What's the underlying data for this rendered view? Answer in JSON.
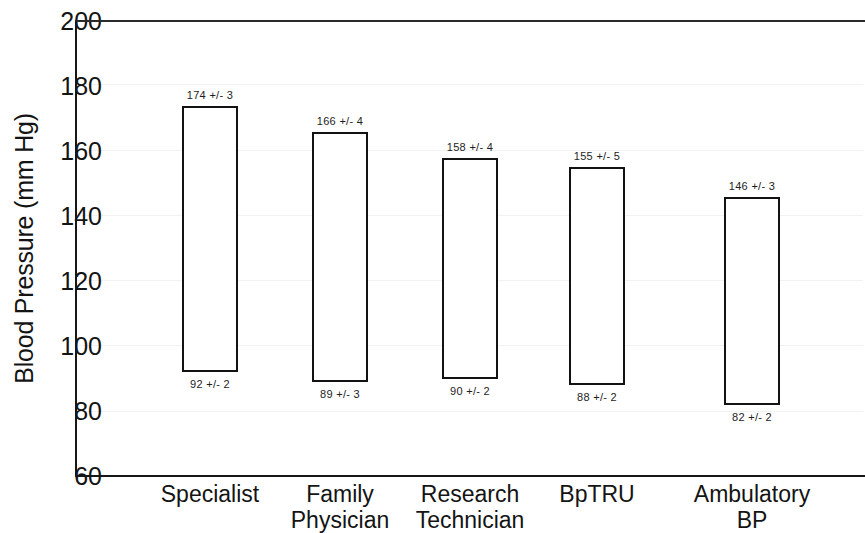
{
  "chart_data": {
    "type": "bar",
    "subtype": "floating-range-bar",
    "title": "",
    "xlabel": "",
    "ylabel": "Blood Pressure (mm Hg)",
    "ylim": [
      60,
      200
    ],
    "yticks": [
      200,
      180,
      160,
      140,
      120,
      100,
      80,
      60
    ],
    "ytick_labels": [
      "200",
      "180",
      "160",
      "140",
      "120",
      "100",
      "80",
      "60"
    ],
    "grid": false,
    "legend": null,
    "categories": [
      "Specialist",
      "Family\nPhysician",
      "Research\nTechnician",
      "BpTRU",
      "Ambulatory\nBP"
    ],
    "series": [
      {
        "name": "Systolic",
        "values": [
          174,
          166,
          158,
          155,
          146
        ],
        "errors": [
          3,
          4,
          4,
          5,
          3
        ],
        "labels": [
          "174 +/- 3",
          "166 +/- 4",
          "158 +/- 4",
          "155 +/- 5",
          "146 +/- 3"
        ]
      },
      {
        "name": "Diastolic",
        "values": [
          92,
          89,
          90,
          88,
          82
        ],
        "errors": [
          2,
          3,
          2,
          2,
          2
        ],
        "labels": [
          "92 +/- 2",
          "89 +/- 3",
          "90 +/- 2",
          "88 +/- 2",
          "82 +/- 2"
        ]
      }
    ],
    "bars": [
      {
        "category": "Specialist",
        "systolic": 174,
        "diastolic": 92,
        "top_label": "174 +/- 3",
        "bottom_label": "92 +/- 2"
      },
      {
        "category": "Family Physician",
        "systolic": 166,
        "diastolic": 89,
        "top_label": "166 +/- 4",
        "bottom_label": "89 +/- 3"
      },
      {
        "category": "Research Technician",
        "systolic": 158,
        "diastolic": 90,
        "top_label": "158 +/- 4",
        "bottom_label": "90 +/- 2"
      },
      {
        "category": "BpTRU",
        "systolic": 155,
        "diastolic": 88,
        "top_label": "155 +/- 5",
        "bottom_label": "88 +/- 2"
      },
      {
        "category": "Ambulatory BP",
        "systolic": 146,
        "diastolic": 82,
        "top_label": "146 +/- 3",
        "bottom_label": "82 +/- 2"
      }
    ],
    "colors": {
      "bar_fill": "#ffffff",
      "bar_stroke": "#121212",
      "axis": "#171717",
      "text": "#141414",
      "background": "#ffffff"
    }
  }
}
